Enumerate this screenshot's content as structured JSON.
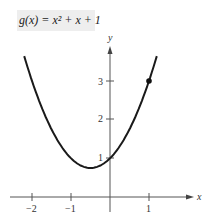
{
  "title": "g(x) = x² + x + 1",
  "caption": "",
  "chart_data": {
    "type": "line",
    "xlabel": "x",
    "ylabel": "y",
    "xlim": [
      -2.2,
      1.3
    ],
    "ylim": [
      0,
      3.8
    ],
    "x_ticks": [
      -2,
      -1,
      1
    ],
    "y_ticks": [
      1,
      2,
      3
    ],
    "grid": false,
    "series": [
      {
        "name": "g(x) = x^2 + x + 1",
        "x": [
          -2.2,
          -2,
          -1.5,
          -1,
          -0.5,
          0,
          0.5,
          1,
          1.2
        ],
        "values": [
          3.64,
          3,
          1.75,
          1,
          0.75,
          1,
          1.75,
          3,
          3.64
        ]
      }
    ],
    "highlighted_points": [
      {
        "x": 1,
        "y": 3
      }
    ],
    "vertex": {
      "x": -0.5,
      "y": 0.75
    }
  },
  "axes": {
    "x_label": "x",
    "y_label": "y",
    "x_tick_labels": [
      "−2",
      "−1",
      "1"
    ],
    "y_tick_labels": [
      "1",
      "2",
      "3"
    ]
  }
}
